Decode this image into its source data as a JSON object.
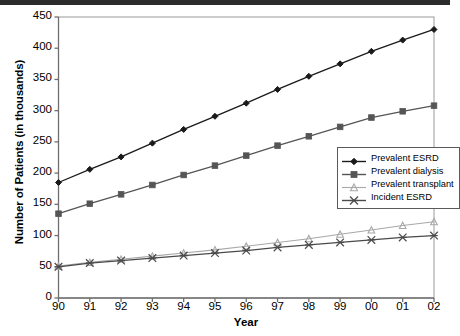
{
  "chart_data": {
    "type": "line",
    "title": "",
    "xlabel": "Year",
    "ylabel": "Number of Patients (in thousands)",
    "categories": [
      "90",
      "91",
      "92",
      "93",
      "94",
      "95",
      "96",
      "97",
      "98",
      "99",
      "00",
      "01",
      "02"
    ],
    "xlim": [
      0,
      12
    ],
    "ylim": [
      0,
      450
    ],
    "yticks": [
      0,
      50,
      100,
      150,
      200,
      250,
      300,
      350,
      400,
      450
    ],
    "grid": false,
    "legend_position": "middle-right",
    "series": [
      {
        "name": "Prevalent ESRD",
        "marker": "diamond",
        "color": "#1a1a1a",
        "values": [
          185,
          206,
          226,
          248,
          270,
          291,
          312,
          334,
          355,
          375,
          395,
          413,
          430
        ]
      },
      {
        "name": "Prevalent dialysis",
        "marker": "square",
        "color": "#555555",
        "values": [
          135,
          151,
          166,
          181,
          197,
          212,
          228,
          244,
          259,
          274,
          289,
          299,
          308
        ]
      },
      {
        "name": "Prevalent transplant",
        "marker": "triangle",
        "color": "#a8a8a8",
        "values": [
          51,
          57,
          62,
          67,
          72,
          77,
          83,
          89,
          95,
          102,
          109,
          116,
          122
        ]
      },
      {
        "name": "Incident ESRD",
        "marker": "x",
        "color": "#4a4a4a",
        "values": [
          50,
          56,
          60,
          64,
          68,
          72,
          76,
          81,
          85,
          89,
          93,
          97,
          100
        ]
      }
    ]
  }
}
